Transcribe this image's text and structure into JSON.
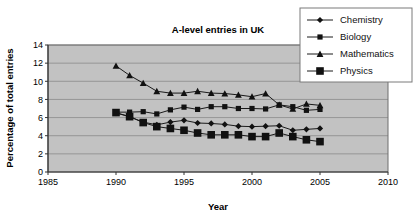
{
  "chart_data": {
    "type": "line",
    "title": "A-level entries in UK",
    "xlabel": "Year",
    "ylabel": "Percentage of total entries",
    "xlim": [
      1985,
      2010
    ],
    "ylim": [
      0,
      14
    ],
    "xticks": [
      "1985",
      "1990",
      "1995",
      "2000",
      "2005",
      "2010"
    ],
    "yticks": [
      "0",
      "2",
      "4",
      "6",
      "8",
      "10",
      "12",
      "14"
    ],
    "grid": "horizontal",
    "legend_position": "top-right",
    "plot_background": "#c2c2c2",
    "x": [
      1990,
      1991,
      1992,
      1993,
      1994,
      1995,
      1996,
      1997,
      1998,
      1999,
      2000,
      2001,
      2002,
      2003,
      2004,
      2005
    ],
    "series": [
      {
        "name": "Chemistry",
        "marker": "diamond",
        "color": "#111111",
        "values": [
          6.5,
          6.1,
          5.5,
          5.2,
          5.5,
          5.7,
          5.4,
          5.35,
          5.25,
          5.05,
          5.0,
          5.05,
          5.1,
          4.6,
          4.7,
          4.8
        ]
      },
      {
        "name": "Biology",
        "marker": "square-small",
        "color": "#111111",
        "values": [
          6.6,
          6.6,
          6.65,
          6.4,
          6.85,
          7.15,
          6.9,
          7.2,
          7.2,
          7.0,
          7.0,
          6.95,
          7.4,
          7.2,
          6.8,
          6.9
        ]
      },
      {
        "name": "Mathematics",
        "marker": "triangle",
        "color": "#111111",
        "values": [
          11.7,
          10.65,
          9.8,
          8.9,
          8.7,
          8.7,
          8.9,
          8.7,
          8.65,
          8.5,
          8.3,
          8.65,
          7.4,
          6.95,
          7.5,
          7.35
        ]
      },
      {
        "name": "Physics",
        "marker": "square-large",
        "color": "#111111",
        "values": [
          6.55,
          6.1,
          5.45,
          5.0,
          4.8,
          4.6,
          4.3,
          4.1,
          4.1,
          4.1,
          3.9,
          3.9,
          4.3,
          3.9,
          3.55,
          3.35
        ]
      }
    ]
  },
  "legend": {
    "items": [
      {
        "label": "Chemistry",
        "marker": "diamond"
      },
      {
        "label": "Biology",
        "marker": "square-small"
      },
      {
        "label": "Mathematics",
        "marker": "triangle"
      },
      {
        "label": "Physics",
        "marker": "square-large"
      }
    ]
  }
}
